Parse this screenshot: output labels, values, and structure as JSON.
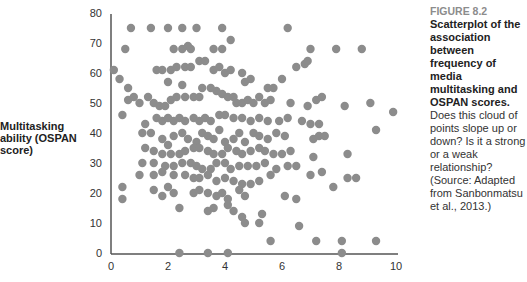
{
  "figure": {
    "number_label": "FIGURE 8.2",
    "title": "Scatterplot of the association between frequency of media multitasking and OSPAN scores.",
    "body": "Does this cloud of points slope up or down? Is it a strong or a weak relationship? (Source: Adapted from Sanbonmatsu et al., 2013.)"
  },
  "y_axis_label": "Multitasking ability (OSPAN score)",
  "colors": {
    "point": "#8c8c8c",
    "axis": "#555555"
  },
  "chart_data": {
    "type": "scatter",
    "title": "",
    "xlabel": "",
    "ylabel": "Multitasking ability (OSPAN score)",
    "xlim": [
      0,
      10
    ],
    "ylim": [
      0,
      80
    ],
    "x_ticks": [
      0,
      2,
      4,
      6,
      8,
      10
    ],
    "y_ticks": [
      0,
      10,
      20,
      30,
      40,
      50,
      60,
      70,
      80
    ],
    "grid": false,
    "legend": null,
    "points": [
      [
        0.7,
        75
      ],
      [
        1.4,
        75
      ],
      [
        2.0,
        75
      ],
      [
        2.5,
        75
      ],
      [
        3.0,
        75
      ],
      [
        3.9,
        75
      ],
      [
        6.2,
        75
      ],
      [
        0.5,
        68
      ],
      [
        2.2,
        68
      ],
      [
        2.5,
        68
      ],
      [
        2.7,
        69
      ],
      [
        2.8,
        68
      ],
      [
        3.6,
        68
      ],
      [
        3.9,
        68
      ],
      [
        4.2,
        71
      ],
      [
        7.0,
        68
      ],
      [
        7.9,
        68
      ],
      [
        8.8,
        68
      ],
      [
        0.1,
        61
      ],
      [
        0.3,
        58
      ],
      [
        0.6,
        55
      ],
      [
        1.0,
        50
      ],
      [
        0.6,
        51
      ],
      [
        0.8,
        52
      ],
      [
        0.4,
        46
      ],
      [
        1.2,
        43
      ],
      [
        1.3,
        52
      ],
      [
        1.6,
        61
      ],
      [
        1.8,
        61
      ],
      [
        2.1,
        61
      ],
      [
        2.3,
        62
      ],
      [
        2.6,
        62
      ],
      [
        2.8,
        62
      ],
      [
        2.0,
        57
      ],
      [
        2.5,
        56
      ],
      [
        3.1,
        64
      ],
      [
        3.3,
        64
      ],
      [
        3.6,
        61
      ],
      [
        3.8,
        62
      ],
      [
        4.0,
        60
      ],
      [
        4.2,
        61
      ],
      [
        4.6,
        60
      ],
      [
        4.7,
        57
      ],
      [
        4.9,
        58
      ],
      [
        5.5,
        55
      ],
      [
        5.7,
        55
      ],
      [
        6.0,
        58
      ],
      [
        6.5,
        62
      ],
      [
        6.8,
        63
      ],
      [
        6.9,
        64
      ],
      [
        1.5,
        50
      ],
      [
        1.7,
        49
      ],
      [
        1.9,
        49
      ],
      [
        2.1,
        51
      ],
      [
        2.3,
        52
      ],
      [
        2.6,
        52
      ],
      [
        2.9,
        52
      ],
      [
        3.1,
        52
      ],
      [
        3.2,
        55
      ],
      [
        3.5,
        55
      ],
      [
        3.7,
        54
      ],
      [
        3.9,
        53
      ],
      [
        4.1,
        52
      ],
      [
        4.3,
        52
      ],
      [
        4.4,
        50
      ],
      [
        4.6,
        50
      ],
      [
        4.8,
        51
      ],
      [
        5.0,
        50
      ],
      [
        5.2,
        52
      ],
      [
        5.4,
        50
      ],
      [
        5.6,
        51
      ],
      [
        6.3,
        50
      ],
      [
        6.9,
        49
      ],
      [
        7.2,
        51
      ],
      [
        7.4,
        52
      ],
      [
        8.2,
        49
      ],
      [
        1.6,
        45
      ],
      [
        1.8,
        44
      ],
      [
        2.0,
        45
      ],
      [
        2.2,
        44
      ],
      [
        2.4,
        45
      ],
      [
        2.6,
        44
      ],
      [
        2.9,
        45
      ],
      [
        3.1,
        44
      ],
      [
        3.3,
        45
      ],
      [
        3.5,
        44
      ],
      [
        3.8,
        46
      ],
      [
        4.0,
        46
      ],
      [
        4.3,
        45
      ],
      [
        4.6,
        45
      ],
      [
        4.9,
        44
      ],
      [
        5.2,
        45
      ],
      [
        5.5,
        44
      ],
      [
        5.9,
        44
      ],
      [
        6.2,
        45
      ],
      [
        6.7,
        44
      ],
      [
        7.0,
        43
      ],
      [
        7.3,
        43
      ],
      [
        9.1,
        50
      ],
      [
        9.9,
        47
      ],
      [
        9.3,
        41
      ],
      [
        1.1,
        40
      ],
      [
        1.4,
        40
      ],
      [
        1.8,
        38
      ],
      [
        2.0,
        36
      ],
      [
        2.2,
        39
      ],
      [
        2.5,
        40
      ],
      [
        2.7,
        38
      ],
      [
        3.0,
        37
      ],
      [
        3.2,
        40
      ],
      [
        3.4,
        39
      ],
      [
        3.6,
        38
      ],
      [
        3.8,
        41
      ],
      [
        4.0,
        37
      ],
      [
        4.3,
        38
      ],
      [
        4.5,
        40
      ],
      [
        4.7,
        37
      ],
      [
        5.0,
        40
      ],
      [
        5.2,
        39
      ],
      [
        5.5,
        38
      ],
      [
        5.8,
        40
      ],
      [
        6.1,
        39
      ],
      [
        7.1,
        38
      ],
      [
        7.3,
        39
      ],
      [
        7.5,
        39
      ],
      [
        1.2,
        35
      ],
      [
        1.5,
        34
      ],
      [
        1.8,
        33
      ],
      [
        2.1,
        33
      ],
      [
        2.4,
        33
      ],
      [
        2.6,
        34
      ],
      [
        2.9,
        35
      ],
      [
        3.1,
        35
      ],
      [
        3.4,
        34
      ],
      [
        3.6,
        33
      ],
      [
        3.9,
        33
      ],
      [
        4.1,
        35
      ],
      [
        4.4,
        34
      ],
      [
        4.6,
        33
      ],
      [
        4.9,
        34
      ],
      [
        5.2,
        35
      ],
      [
        5.4,
        34
      ],
      [
        5.7,
        33
      ],
      [
        6.0,
        33
      ],
      [
        6.3,
        34
      ],
      [
        7.1,
        32
      ],
      [
        8.3,
        33
      ],
      [
        1.1,
        30
      ],
      [
        1.5,
        30
      ],
      [
        1.9,
        29
      ],
      [
        2.2,
        29
      ],
      [
        2.5,
        30
      ],
      [
        2.8,
        30
      ],
      [
        3.0,
        29
      ],
      [
        3.2,
        28
      ],
      [
        3.5,
        28
      ],
      [
        3.7,
        30
      ],
      [
        4.0,
        30
      ],
      [
        4.2,
        28
      ],
      [
        4.5,
        29
      ],
      [
        4.8,
        29
      ],
      [
        5.1,
        29
      ],
      [
        5.4,
        30
      ],
      [
        5.8,
        28
      ],
      [
        6.2,
        29
      ],
      [
        6.5,
        29
      ],
      [
        1.0,
        26
      ],
      [
        1.5,
        26
      ],
      [
        1.8,
        27
      ],
      [
        2.2,
        26
      ],
      [
        2.6,
        26
      ],
      [
        2.9,
        25
      ],
      [
        3.1,
        25
      ],
      [
        3.4,
        26
      ],
      [
        3.7,
        24
      ],
      [
        4.0,
        25
      ],
      [
        4.3,
        24
      ],
      [
        4.6,
        23
      ],
      [
        4.9,
        23
      ],
      [
        5.2,
        24
      ],
      [
        5.6,
        26
      ],
      [
        7.0,
        26
      ],
      [
        7.4,
        27
      ],
      [
        8.6,
        25
      ],
      [
        0.4,
        22
      ],
      [
        0.4,
        18
      ],
      [
        1.5,
        21
      ],
      [
        1.8,
        19
      ],
      [
        2.0,
        22
      ],
      [
        2.2,
        20
      ],
      [
        2.9,
        20
      ],
      [
        3.1,
        21
      ],
      [
        3.4,
        20
      ],
      [
        3.7,
        19
      ],
      [
        3.9,
        20
      ],
      [
        4.1,
        18
      ],
      [
        4.5,
        21
      ],
      [
        4.7,
        19
      ],
      [
        6.1,
        19
      ],
      [
        6.5,
        18
      ],
      [
        7.8,
        22
      ],
      [
        8.3,
        25
      ],
      [
        2.4,
        15
      ],
      [
        3.4,
        14
      ],
      [
        3.6,
        15
      ],
      [
        4.1,
        16
      ],
      [
        4.3,
        14
      ],
      [
        4.6,
        12
      ],
      [
        4.7,
        10
      ],
      [
        5.3,
        13
      ],
      [
        5.2,
        10
      ],
      [
        6.6,
        9
      ],
      [
        5.6,
        4
      ],
      [
        7.2,
        4
      ],
      [
        8.1,
        4
      ],
      [
        9.3,
        4
      ],
      [
        2.4,
        0
      ],
      [
        3.4,
        0
      ],
      [
        4.1,
        0
      ],
      [
        8.1,
        0
      ]
    ]
  }
}
